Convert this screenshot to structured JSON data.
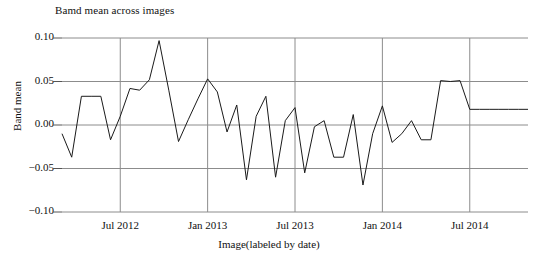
{
  "chart_data": {
    "type": "line",
    "title": "Bamd mean across images",
    "xlabel": "Image(labeled by date)",
    "ylabel": "Band mean",
    "grid": true,
    "legend": "none",
    "line_color": "#1a1a1a",
    "grid_color": "#8c8c8c",
    "ylim": [
      -0.1,
      0.1
    ],
    "yticks": [
      "0.10",
      "0.05",
      "0.00",
      "−0.05",
      "−0.10"
    ],
    "ytick_values": [
      0.1,
      0.05,
      0.0,
      -0.05,
      -0.1
    ],
    "xticks": [
      "Jul 2012",
      "Jan 2013",
      "Jul 2013",
      "Jan 2014",
      "Jul 2014"
    ],
    "xtick_positions": [
      6,
      15,
      24,
      33,
      42
    ],
    "x": [
      0,
      1,
      2,
      3,
      4,
      5,
      6,
      7,
      8,
      9,
      10,
      11,
      12,
      13,
      14,
      15,
      16,
      17,
      18,
      19,
      20,
      21,
      22,
      23,
      24,
      25,
      26,
      27,
      28,
      29,
      30,
      31,
      32,
      33,
      34,
      35,
      36,
      37,
      38,
      39,
      40,
      41,
      42,
      43,
      44,
      45,
      46,
      47,
      48
    ],
    "values": [
      -0.01,
      -0.037,
      0.033,
      0.033,
      0.033,
      -0.017,
      0.01,
      0.042,
      0.04,
      0.052,
      0.097,
      0.04,
      -0.019,
      0.006,
      0.03,
      0.053,
      0.038,
      -0.008,
      0.023,
      -0.063,
      0.01,
      0.033,
      -0.06,
      0.005,
      0.02,
      -0.055,
      -0.002,
      0.005,
      -0.037,
      -0.037,
      0.012,
      -0.069,
      -0.01,
      0.022,
      -0.02,
      -0.01,
      0.005,
      -0.017,
      -0.017,
      0.051,
      0.05,
      0.051,
      0.018,
      0.018,
      0.018,
      0.018,
      0.018,
      0.018,
      0.018
    ]
  }
}
